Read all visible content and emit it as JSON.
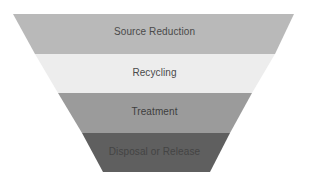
{
  "diagram": {
    "type": "inverted-pyramid",
    "tiers": [
      {
        "label": "Source Reduction",
        "fill": "#b9b9b9",
        "text_color": "#4a4a4a"
      },
      {
        "label": "Recycling",
        "fill": "#ededed",
        "text_color": "#4a4a4a"
      },
      {
        "label": "Treatment",
        "fill": "#9b9b9b",
        "text_color": "#3e3e3e"
      },
      {
        "label": "Disposal or Release",
        "fill": "#5f5f5f",
        "text_color": "#444444"
      }
    ]
  }
}
